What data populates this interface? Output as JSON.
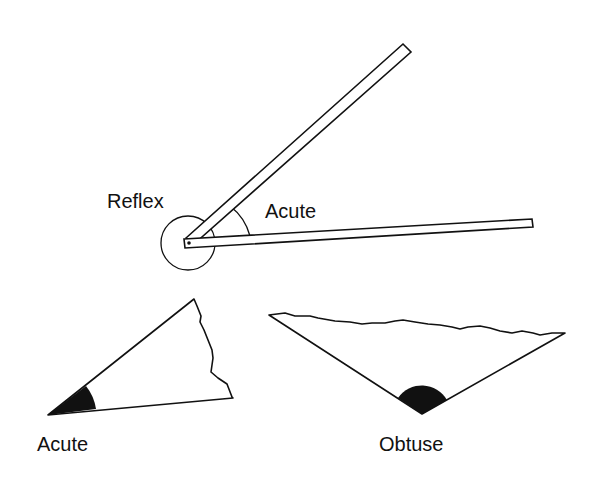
{
  "diagram": {
    "labels": {
      "reflex": "Reflex",
      "acute_top": "Acute",
      "acute_bottom": "Acute",
      "obtuse": "Obtuse"
    },
    "colors": {
      "stroke": "#111111",
      "fill_angle": "#111111",
      "background": "#ffffff"
    },
    "elements": [
      {
        "name": "hinged-rulers",
        "pivot": [
          188,
          243
        ],
        "arm_upper_end": [
          408,
          48
        ],
        "arm_lower_end": [
          533,
          222
        ]
      },
      {
        "name": "torn-triangle-acute",
        "vertices": [
          [
            48,
            415
          ],
          [
            194,
            299
          ],
          [
            233,
            397
          ]
        ]
      },
      {
        "name": "torn-triangle-obtuse",
        "vertices": [
          [
            269,
            315
          ],
          [
            565,
            333
          ],
          [
            422,
            414
          ]
        ]
      }
    ]
  }
}
